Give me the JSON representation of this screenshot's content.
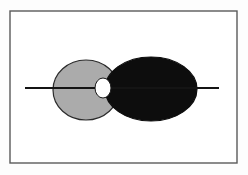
{
  "figure": {
    "title": "Two overlapping ellipses bisected by a horizontal axis",
    "caption": "",
    "width": 248,
    "height": 175,
    "background_color": "#fdfdfd"
  },
  "frame": {
    "name": "figure-border",
    "x": 10,
    "y": 11,
    "width": 227,
    "height": 152,
    "stroke_color": "#5a5a5a",
    "stroke_width": 1.4,
    "fill_color": "#ffffff"
  },
  "axis_line": {
    "name": "horizontal-axis-line",
    "x1": 25,
    "y1": 88,
    "x2": 219,
    "y2": 88,
    "stroke_color": "#141414",
    "stroke_width": 1.9
  },
  "shapes": [
    {
      "name": "left-ellipse",
      "role": "light-ellipse",
      "cx": 86,
      "cy": 90,
      "rx": 33,
      "ry": 30,
      "fill_color": "#ababab",
      "stroke_color": "#2b2b2b",
      "stroke_width": 1.2,
      "label": "Light gray ellipse"
    },
    {
      "name": "right-ellipse",
      "role": "dark-ellipse",
      "cx": 151,
      "cy": 89,
      "rx": 46,
      "ry": 32,
      "fill_color": "#0d0d0d",
      "stroke_color": "#0d0d0d",
      "stroke_width": 1.2,
      "label": "Black ellipse"
    },
    {
      "name": "intersection-ellipse",
      "role": "white-ellipse",
      "cx": 103,
      "cy": 88,
      "rx": 8,
      "ry": 10,
      "fill_color": "#ffffff",
      "stroke_color": "#1a1a1a",
      "stroke_width": 1.0,
      "label": "White intersection ellipse"
    }
  ],
  "colors": {
    "light_gray": "#ababab",
    "black": "#0d0d0d",
    "white": "#ffffff",
    "border_gray": "#5a5a5a",
    "line_black": "#141414"
  }
}
